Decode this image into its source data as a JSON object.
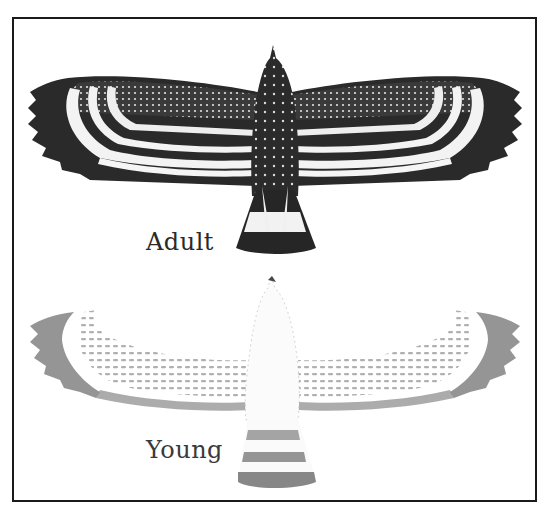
{
  "plate": {
    "labels": {
      "adult": "Adult",
      "young": "Young"
    }
  },
  "figures": [
    {
      "name": "adult",
      "description": "Adult bird from above, wings spread: dark body with white spots, barred flight feathers, black-and-white banded tail",
      "colors": {
        "body": "#2e2e2e",
        "spots": "#e8e8e8",
        "bars_dark": "#1c1c1c",
        "bars_light": "#f2f2f2"
      }
    },
    {
      "name": "young",
      "description": "Young bird from above, wings spread: pale white body, lightly barred grey flight feathers, grey-banded tail",
      "colors": {
        "body": "#f7f7f7",
        "bars": "#8a8a8a",
        "tips": "#6e6e6e"
      }
    }
  ],
  "colors": {
    "border": "#1a1a1a",
    "background": "#ffffff",
    "text": "#2a2a2a"
  }
}
